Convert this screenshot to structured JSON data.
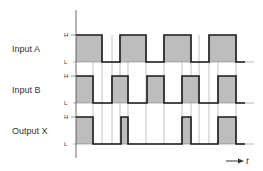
{
  "diagram": {
    "type": "timing-diagram",
    "time_label": "t",
    "level_high": "H",
    "level_low": "L",
    "colors": {
      "fill": "#bdbdbd",
      "line": "#1a1a1a",
      "guide": "#9a9a9a",
      "text": "#333333"
    },
    "signals": [
      {
        "name": "Input A",
        "high_y": 35,
        "low_y": 62,
        "segments": [
          [
            76,
            102
          ],
          [
            120,
            146
          ],
          [
            164,
            191
          ],
          [
            209,
            236
          ]
        ]
      },
      {
        "name": "Input B",
        "high_y": 76,
        "low_y": 103,
        "segments": [
          [
            76,
            93
          ],
          [
            112,
            128
          ],
          [
            147,
            164
          ],
          [
            182,
            199
          ],
          [
            218,
            236
          ]
        ]
      },
      {
        "name": "Output X",
        "high_y": 117,
        "low_y": 144,
        "segments": [
          [
            76,
            93
          ],
          [
            121,
            128
          ],
          [
            182,
            191
          ],
          [
            218,
            236
          ]
        ]
      }
    ],
    "guides": [
      93,
      102,
      112,
      120,
      128,
      146,
      164,
      182,
      191,
      199,
      209,
      218,
      236
    ],
    "x_start": 76,
    "x_end": 245
  }
}
